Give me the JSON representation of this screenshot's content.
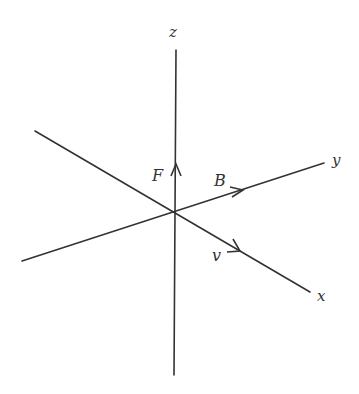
{
  "diagram": {
    "title": "",
    "colors": {
      "line": "#333333",
      "background": "#ffffff"
    },
    "origin": {
      "x": 175,
      "y": 212
    },
    "axes": [
      {
        "id": "z",
        "label": "z",
        "from": {
          "x": 174,
          "y": 375
        },
        "to": {
          "x": 176,
          "y": 50
        },
        "label_pos": {
          "x": 169,
          "y": 25
        }
      },
      {
        "id": "y",
        "label": "y",
        "from": {
          "x": 22,
          "y": 261
        },
        "to": {
          "x": 324,
          "y": 163
        },
        "label_pos": {
          "x": 332,
          "y": 153
        }
      },
      {
        "id": "x",
        "label": "x",
        "from": {
          "x": 35,
          "y": 131
        },
        "to": {
          "x": 310,
          "y": 292
        },
        "label_pos": {
          "x": 317,
          "y": 289
        }
      }
    ],
    "vectors": [
      {
        "id": "F",
        "label": "F",
        "axis": "z",
        "arrow_at": {
          "x": 176,
          "y": 166
        },
        "label_pos": {
          "x": 152,
          "y": 168
        }
      },
      {
        "id": "B",
        "label": "B",
        "axis": "y",
        "arrow_at": {
          "x": 242,
          "y": 190
        },
        "label_pos": {
          "x": 214,
          "y": 173
        }
      },
      {
        "id": "v",
        "label": "v",
        "axis": "x",
        "arrow_at": {
          "x": 238,
          "y": 250
        },
        "label_pos": {
          "x": 212,
          "y": 248
        }
      }
    ]
  }
}
